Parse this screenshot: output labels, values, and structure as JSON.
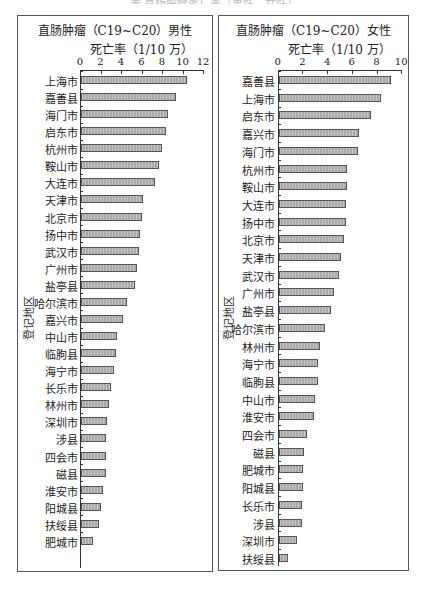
{
  "caption": "表  直肠肿瘤死亡率（男性、女性）",
  "chart_data": [
    {
      "type": "bar",
      "orientation": "horizontal",
      "title": "直肠肿瘤（C19~C20）男性",
      "xlabel": "死亡率（1/10 万）",
      "ylabel": "登记地区",
      "xlim": [
        0,
        12
      ],
      "xticks": [
        0,
        2,
        4,
        6,
        8,
        10,
        12
      ],
      "grid": false,
      "categories": [
        "上海市",
        "嘉善县",
        "海门市",
        "启东市",
        "杭州市",
        "鞍山市",
        "大连市",
        "天津市",
        "北京市",
        "扬中市",
        "武汉市",
        "广州市",
        "盐亭县",
        "哈尔滨市",
        "嘉兴市",
        "中山市",
        "临朐县",
        "海宁市",
        "长乐市",
        "林州市",
        "深圳市",
        "涉县",
        "四会市",
        "磁县",
        "淮安市",
        "阳城县",
        "扶绥县",
        "肥城市"
      ],
      "values": [
        10.45,
        9.4,
        8.6,
        8.4,
        8.0,
        7.7,
        7.3,
        6.1,
        6.0,
        5.9,
        5.8,
        5.6,
        5.4,
        4.6,
        4.15,
        3.65,
        3.55,
        3.35,
        3.05,
        2.8,
        2.6,
        2.5,
        2.5,
        2.5,
        2.2,
        2.0,
        1.85,
        1.25
      ]
    },
    {
      "type": "bar",
      "orientation": "horizontal",
      "title": "直肠肿瘤（C19~C20）女性",
      "xlabel": "死亡率（1/10 万）",
      "ylabel": "登记地区",
      "xlim": [
        0,
        10
      ],
      "xticks": [
        0,
        2,
        4,
        6,
        8,
        10
      ],
      "grid": false,
      "categories": [
        "嘉善县",
        "上海市",
        "启东市",
        "嘉兴市",
        "海门市",
        "杭州市",
        "鞍山市",
        "大连市",
        "扬中市",
        "北京市",
        "天津市",
        "武汉市",
        "广州市",
        "盐亭县",
        "哈尔滨市",
        "林州市",
        "海宁市",
        "临朐县",
        "中山市",
        "淮安市",
        "四会市",
        "磁县",
        "肥城市",
        "阳城县",
        "长乐市",
        "涉县",
        "深圳市",
        "扶绥县"
      ],
      "values": [
        9.2,
        8.35,
        7.55,
        6.55,
        6.5,
        5.65,
        5.6,
        5.5,
        5.5,
        5.35,
        5.1,
        4.95,
        4.6,
        4.3,
        3.85,
        3.4,
        3.25,
        3.25,
        3.05,
        2.95,
        2.35,
        2.15,
        2.05,
        2.05,
        2.0,
        2.0,
        1.6,
        0.8
      ]
    }
  ],
  "colors": {
    "bar_fill": "#a9a9a9",
    "bar_border": "#555555",
    "axis": "#333333",
    "frame": "#555555"
  }
}
